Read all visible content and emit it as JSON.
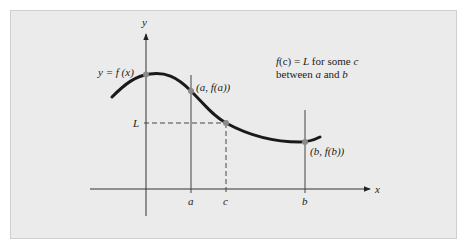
{
  "figure": {
    "axes": {
      "x_label": "x",
      "y_label": "y"
    },
    "curve_label": "y = f (x)",
    "points": {
      "a_label": "(a, f(a))",
      "b_label": "(b, f(b))"
    },
    "ticks": {
      "a": "a",
      "b": "b",
      "c": "c",
      "L": "L"
    },
    "annotation": {
      "line1_f": "f",
      "line1_mid": "(c) = ",
      "line1_L": "L",
      "line1_rest": " for some ",
      "line1_c": "c",
      "line2_pre": "between ",
      "line2_a": "a",
      "line2_and": " and ",
      "line2_b": "b"
    },
    "colors": {
      "panel_bg": "#ebebeb",
      "curve": "#1a1a1a",
      "axis": "#333333",
      "point": "#888888"
    }
  }
}
